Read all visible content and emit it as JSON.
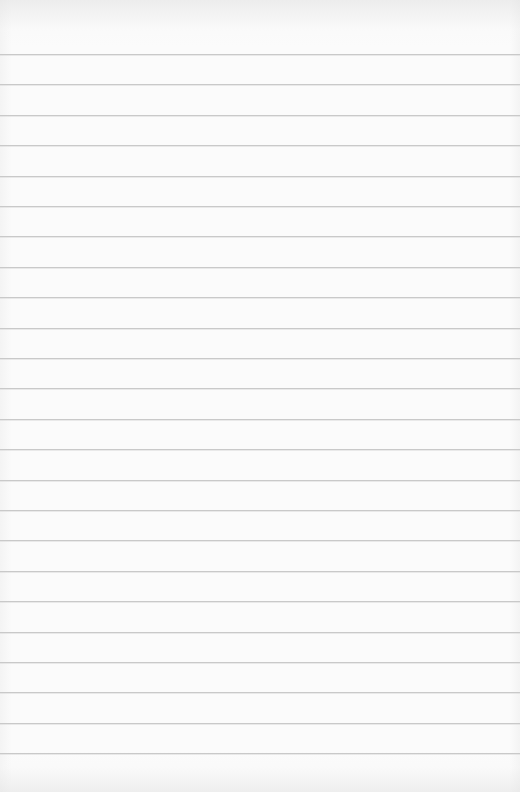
{
  "paper": {
    "type": "ruled-notebook-page",
    "background_color": "#fbfbfb",
    "rule_color": "#c9c9c9",
    "rule_count": 24,
    "first_rule_y": 54,
    "rule_spacing": 30.4,
    "handwritten_text": ""
  }
}
